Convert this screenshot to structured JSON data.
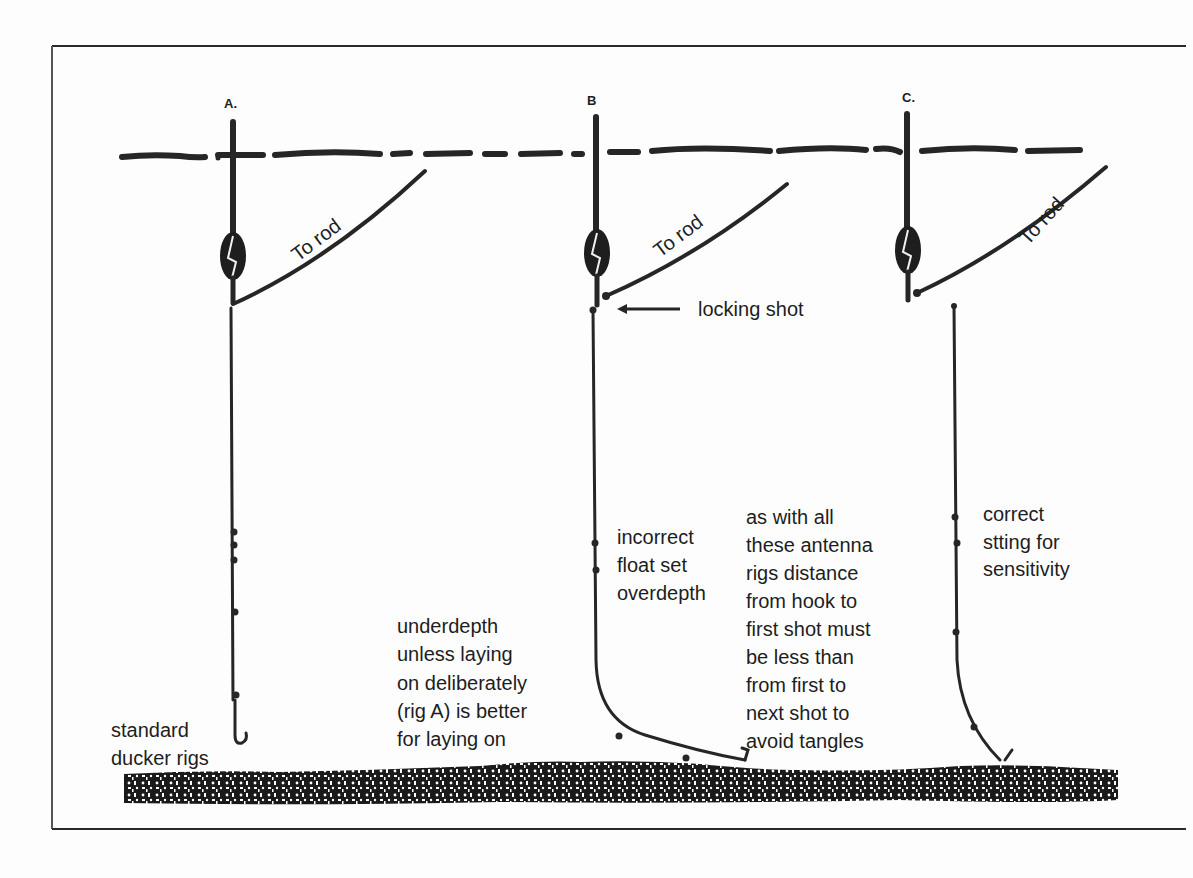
{
  "diagram": {
    "type": "fishing float rig illustration",
    "colors": {
      "ink": "#262626",
      "paper": "#fdfdfd",
      "bed": "#1a1a1a"
    },
    "rigs": [
      {
        "id": "A",
        "letter": "A.",
        "rod_label": "To rod",
        "caption": [
          "standard",
          "ducker rigs"
        ]
      },
      {
        "id": "B",
        "letter": "B",
        "rod_label": "To rod",
        "pointer_label": "locking shot",
        "caption": [
          "incorrect",
          "float set",
          "overdepth"
        ]
      },
      {
        "id": "C",
        "letter": "C.",
        "rod_label": "To rod",
        "caption": [
          "correct",
          "stting for",
          "sensitivity"
        ]
      }
    ],
    "notes": {
      "underdepth": [
        "underdepth",
        "unless laying",
        "on deliberately",
        "(rig A) is better",
        "for laying on"
      ],
      "antenna": [
        "as with all",
        "these antenna",
        "rigs distance",
        "from hook to",
        "first shot must",
        "be less than",
        "from first to",
        "next shot to",
        "avoid tangles"
      ]
    },
    "elements": {
      "surface": "water-surface-line",
      "bed": "river-bed"
    }
  }
}
